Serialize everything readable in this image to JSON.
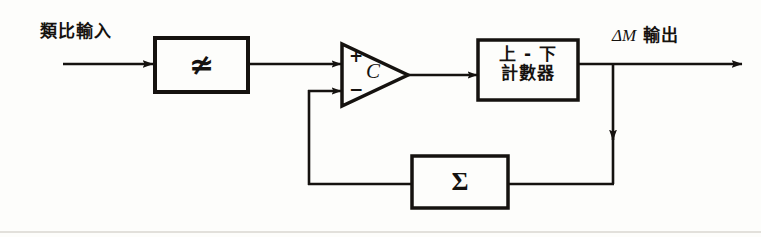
{
  "diagram": {
    "stroke_color": "#15120f",
    "background_color": "#fdfdfb",
    "labels": {
      "analog_input": "類比輸入",
      "output_delta": "ΔM",
      "output_suffix": "輸出",
      "counter_line1": "上 - 下",
      "counter_line2": "計數器"
    },
    "symbols": {
      "ac_block": "≄",
      "summation": "Σ",
      "comparator": "C",
      "plus": "+",
      "minus": "−"
    },
    "blocks": [
      {
        "name": "ac-signal-block",
        "symbol": "≄",
        "x": 155,
        "y": 38,
        "w": 93,
        "h": 54
      },
      {
        "name": "up-down-counter-block",
        "label": "上 - 下 計數器",
        "x": 478,
        "y": 40,
        "w": 100,
        "h": 60
      },
      {
        "name": "summation-block",
        "symbol": "Σ",
        "x": 412,
        "y": 156,
        "w": 96,
        "h": 52
      }
    ],
    "comparator": {
      "name": "comparator",
      "label": "C",
      "x": 342,
      "y": 44,
      "w": 66,
      "h": 62
    },
    "connections": [
      "analog-input-to-ac-block",
      "ac-block-to-comparator-plus",
      "comparator-to-counter",
      "counter-to-output",
      "output-branch-down-to-summation-output",
      "summation-to-comparator-minus"
    ]
  }
}
